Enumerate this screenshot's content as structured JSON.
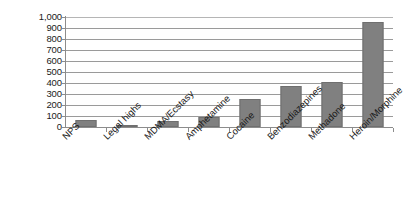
{
  "chart_data": {
    "type": "bar",
    "title": "",
    "subtitle": "",
    "xlabel": "",
    "ylabel": "",
    "categories": [
      "NPS",
      "Legal highs",
      "MDMA/Ecstasy",
      "Amphetamine",
      "Cocaine",
      "Benzodiazepines",
      "Methadone",
      "Heroin/Morphine"
    ],
    "values": [
      60,
      18,
      52,
      88,
      253,
      375,
      410,
      958
    ],
    "ylim": [
      0,
      1000
    ],
    "ytick_labels": [
      "1,000",
      "900",
      "800",
      "700",
      "600",
      "500",
      "400",
      "300",
      "200",
      "100",
      "0"
    ],
    "ytick_values": [
      1000,
      900,
      800,
      700,
      600,
      500,
      400,
      300,
      200,
      100,
      0
    ],
    "grid": true,
    "grid_axis": "y",
    "legend": false,
    "legend_position": "none",
    "bar_color": "#808080",
    "bar_border_color": "#6f6f6f",
    "gridline_color": "#9a9a9a",
    "axis_color": "#8c8c8c",
    "background": "#ffffff",
    "xlabel_rotation": -45
  }
}
